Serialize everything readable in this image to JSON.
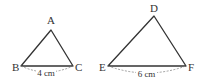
{
  "diagram": {
    "colors": {
      "stroke": "#333333",
      "dashed": "#888888",
      "text": "#333333",
      "background": "#ffffff"
    },
    "triangles": [
      {
        "name": "ABC",
        "vertices": {
          "A": "A",
          "B": "B",
          "C": "C"
        },
        "base_label": "4 cm"
      },
      {
        "name": "DEF",
        "vertices": {
          "D": "D",
          "E": "E",
          "F": "F"
        },
        "base_label": "6 cm"
      }
    ]
  }
}
